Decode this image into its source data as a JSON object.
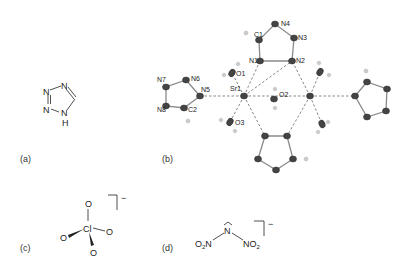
{
  "figure": {
    "panels": [
      {
        "id": "a",
        "label": "(a)",
        "description": "1H-tetrazole structure",
        "atoms": [
          "N",
          "N",
          "N",
          "N",
          "H"
        ]
      },
      {
        "id": "b",
        "label": "(b)",
        "description": "Sr coordination environment",
        "atom_labels": [
          "C1",
          "N4",
          "N3",
          "N1",
          "N2",
          "O1",
          "N7",
          "N6",
          "N5",
          "Sr1",
          "O2",
          "N8",
          "C2",
          "O3"
        ]
      },
      {
        "id": "c",
        "label": "(c)",
        "description": "Perchlorate anion",
        "center": "Cl",
        "atoms": [
          "O",
          "O",
          "O",
          "O"
        ],
        "charge": "−"
      },
      {
        "id": "d",
        "label": "(d)",
        "description": "Dinitramide anion",
        "center": "N",
        "left": "O2N",
        "right": "NO2",
        "charge": "−"
      }
    ]
  }
}
